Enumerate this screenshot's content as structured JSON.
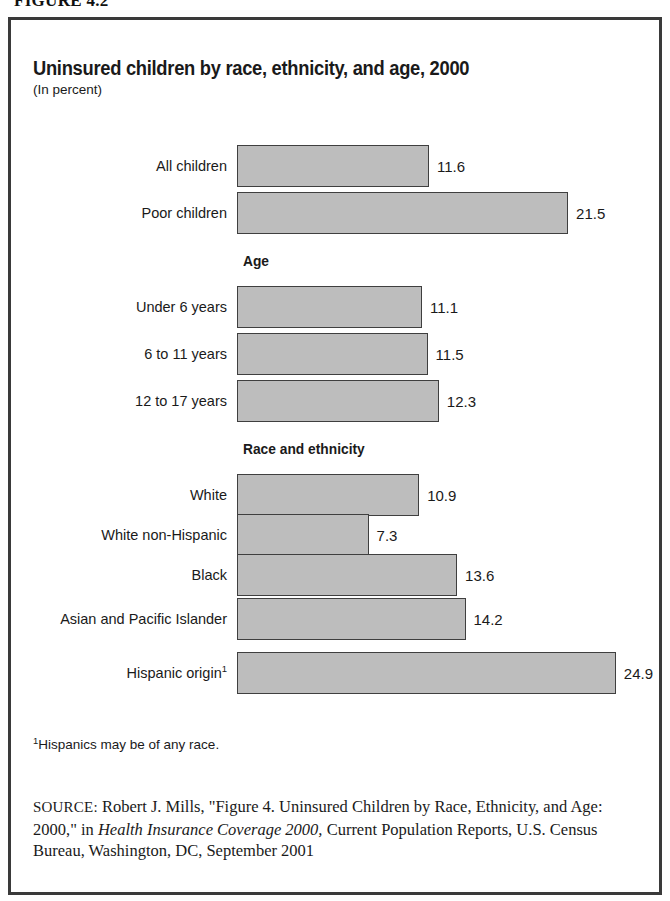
{
  "figure": {
    "caption": "FIGURE 4.2"
  },
  "chart": {
    "title": "Uninsured children by race, ethnicity, and age, 2000",
    "subtitle": "(In percent)"
  },
  "footnote": {
    "marker": "1",
    "text": "Hispanics may be of any race."
  },
  "source": {
    "tag": "SOURCE:",
    "part1": " Robert J. Mills, \"Figure 4. Uninsured Children by Race, Ethnicity, and Age: 2000,\" in ",
    "italic": "Health Insurance Coverage 2000,",
    "part2": " Current Population Reports, U.S. Census Bureau, Washington, DC, September 2001"
  },
  "chart_data": {
    "type": "bar",
    "orientation": "horizontal",
    "title": "Uninsured children by race, ethnicity, and age, 2000",
    "subtitle": "(In percent)",
    "xlabel": "",
    "ylabel": "",
    "unit": "percent",
    "grid": false,
    "legend": false,
    "xlim": [
      0,
      26
    ],
    "categories": [
      "All children",
      "Poor children",
      "Under 6 years",
      "6 to 11 years",
      "12 to 17 years",
      "White",
      "White non-Hispanic",
      "Black",
      "Asian and Pacific Islander",
      "Hispanic origin"
    ],
    "values": [
      11.6,
      21.5,
      11.1,
      11.5,
      12.3,
      10.9,
      7.3,
      13.6,
      14.2,
      24.9
    ],
    "group_headers": [
      "Age",
      "Race and ethnicity"
    ],
    "bars": [
      {
        "label": "All children",
        "value": 11.6,
        "value_text": "11.6",
        "footnote": "",
        "group": ""
      },
      {
        "label": "Poor children",
        "value": 21.5,
        "value_text": "21.5",
        "footnote": "",
        "group": ""
      },
      {
        "label": "Under 6 years",
        "value": 11.1,
        "value_text": "11.1",
        "footnote": "",
        "group": "Age"
      },
      {
        "label": "6 to 11 years",
        "value": 11.5,
        "value_text": "11.5",
        "footnote": "",
        "group": "Age"
      },
      {
        "label": "12 to 17 years",
        "value": 12.3,
        "value_text": "12.3",
        "footnote": "",
        "group": "Age"
      },
      {
        "label": "White",
        "value": 10.9,
        "value_text": "10.9",
        "footnote": "",
        "group": "Race and ethnicity"
      },
      {
        "label": "White non-Hispanic",
        "value": 7.3,
        "value_text": "7.3",
        "footnote": "",
        "group": "Race and ethnicity"
      },
      {
        "label": "Black",
        "value": 13.6,
        "value_text": "13.6",
        "footnote": "",
        "group": "Race and ethnicity"
      },
      {
        "label": "Asian and Pacific Islander",
        "value": 14.2,
        "value_text": "14.2",
        "footnote": "",
        "group": "Race and ethnicity"
      },
      {
        "label": "Hispanic origin",
        "value": 24.9,
        "value_text": "24.9",
        "footnote": "1",
        "group": "Race and ethnicity"
      }
    ],
    "colors": {
      "bar_fill": "#bdbdbd",
      "bar_border": "#3f3f3f",
      "text": "#1a1a1a",
      "frame": "#3a3a3a",
      "background": "#ffffff"
    }
  },
  "layout": {
    "bar_left_px": 226,
    "bar_height_px": 42,
    "px_per_unit": 14.05,
    "zero_offset_px": 29,
    "rows_top_px": [
      125,
      172,
      266,
      313,
      360,
      454,
      494,
      534,
      578,
      632
    ],
    "group_header_positions": [
      {
        "label": "Age",
        "left": 232,
        "top": 233
      },
      {
        "label": "Race and ethnicity",
        "left": 232,
        "top": 421
      }
    ]
  }
}
